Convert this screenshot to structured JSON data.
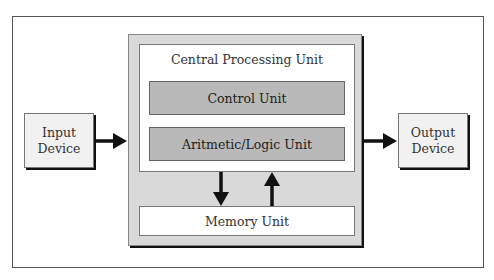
{
  "diagram": {
    "cpu": {
      "title": "Central Processing Unit"
    },
    "control_unit": {
      "label": "Control Unit"
    },
    "alu": {
      "label": "Aritmetic/Logic Unit"
    },
    "memory_unit": {
      "label": "Memory Unit"
    },
    "input_device": {
      "line1": "Input",
      "line2": "Device"
    },
    "output_device": {
      "line1": "Output",
      "line2": "Device"
    },
    "arrows": [
      {
        "from": "input_device",
        "to": "cpu"
      },
      {
        "from": "cpu",
        "to": "output_device"
      },
      {
        "from": "cpu",
        "to": "memory_unit"
      },
      {
        "from": "memory_unit",
        "to": "cpu"
      }
    ],
    "colors": {
      "cpu_fill": "#d9d9d9",
      "unit_fill": "#b9b9b9",
      "device_fill": "#f1f1f1",
      "arrow": "#111111"
    }
  }
}
